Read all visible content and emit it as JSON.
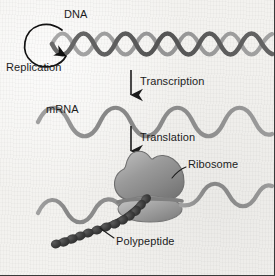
{
  "figure": {
    "background_color": "#f3f2ef",
    "border_color": "#3a3a3a"
  },
  "labels": {
    "dna": "DNA",
    "replication": "Replication",
    "transcription": "Transcription",
    "mrna": "mRNA",
    "translation": "Translation",
    "ribosome": "Ribosome",
    "polypeptide": "Polypeptide"
  },
  "colors": {
    "dna_strand_dark": "#5c5c5c",
    "dna_strand_light": "#9b9b9b",
    "mrna_strand": "#8e8e8e",
    "ribosome_large_subunit": "#8f8f8f",
    "ribosome_small_subunit": "#9a9a9a",
    "polypeptide_bead": "#3a3a3a",
    "arrow": "#1c1c1c",
    "text": "#1c1c1c"
  },
  "elements": {
    "dna_helix": {
      "kind": "double-helix",
      "strands": 2,
      "crossings": 8,
      "x_start": 52,
      "x_end": 272,
      "y_center": 44,
      "amplitude": 14
    },
    "replication_loop": {
      "kind": "circular-arrow",
      "center_x": 38,
      "center_y": 45,
      "radius_x": 16,
      "radius_y": 21,
      "arrowhead": "down-right"
    },
    "transcription_arrow": {
      "kind": "down-arrow",
      "x": 131,
      "y_start": 70,
      "y_end": 97
    },
    "mrna_strand_upper": {
      "kind": "sine-wave",
      "x_start": 38,
      "x_end": 272,
      "y_center": 117,
      "amplitude": 11,
      "periods": 4.5
    },
    "translation_arrow": {
      "kind": "down-arrow",
      "x": 131,
      "y_start": 126,
      "y_end": 153
    },
    "mrna_strand_lower": {
      "kind": "sine-wave",
      "x_start": 38,
      "x_end": 272,
      "y_center": 200,
      "amplitude": 11,
      "periods": 4.5
    },
    "ribosome": {
      "kind": "two-subunit-blob",
      "center_x": 149,
      "large_subunit_y": 178,
      "small_subunit_y": 204
    },
    "polypeptide_chain": {
      "kind": "bead-chain",
      "bead_count": 13,
      "start_x": 146,
      "start_y": 199,
      "end_x": 58,
      "end_y": 243
    },
    "leader_line_ribosome": {
      "from_x": 186,
      "from_y": 167,
      "to_x": 172,
      "to_y": 177
    },
    "leader_line_polypeptide": {
      "from_x": 114,
      "from_y": 238,
      "to_x": 100,
      "to_y": 228
    }
  }
}
